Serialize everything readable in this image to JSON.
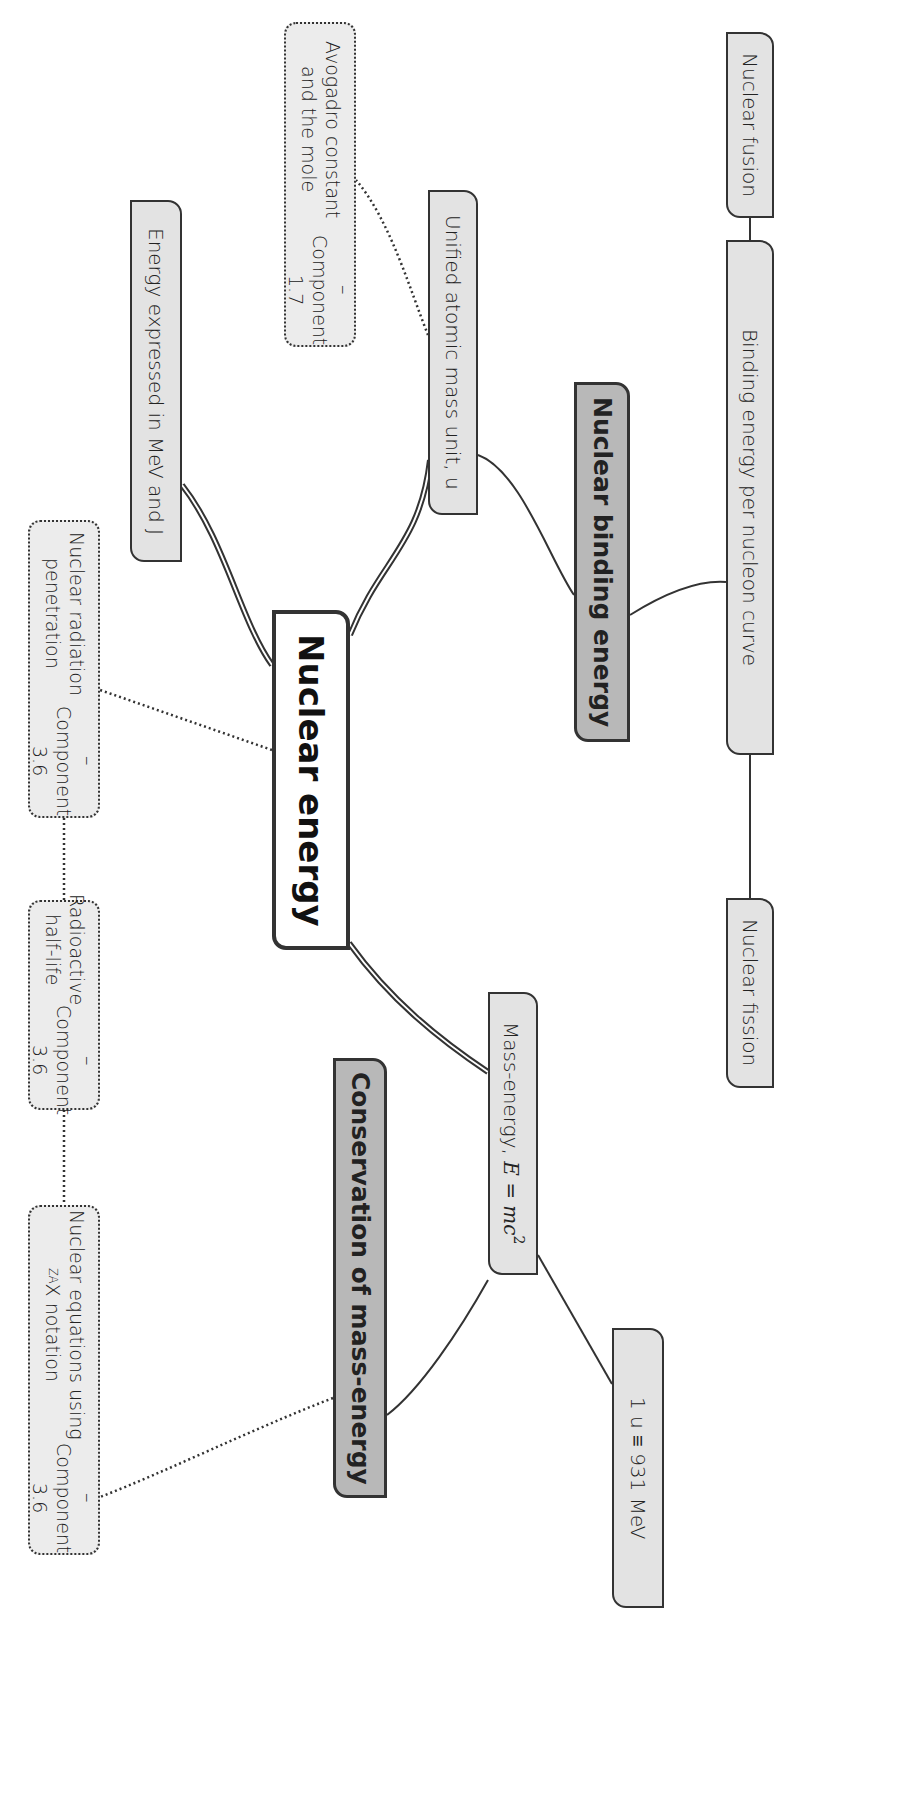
{
  "diagram": {
    "title": "Nuclear energy",
    "orientation": "rotated 90 degrees clockwise",
    "nodes": {
      "center": {
        "label": "Nuclear energy"
      },
      "binding": {
        "label": "Nuclear binding energy"
      },
      "conservation": {
        "label": "Conservation of mass-energy"
      },
      "fusion": {
        "label": "Nuclear fusion"
      },
      "curve": {
        "label": "Binding energy per nucleon curve"
      },
      "fission": {
        "label": "Nuclear fission"
      },
      "amu": {
        "label": "Unified atomic mass unit, u"
      },
      "avogadro": {
        "line1": "Avogadro constant and the mole",
        "line2": "– Component 1.7"
      },
      "mev": {
        "label": "Energy expressed in MeV and J"
      },
      "radiation": {
        "line1": "Nuclear radiation penetration",
        "line2": "– Component 3.6"
      },
      "halflife": {
        "line1": "Radioactive half-life",
        "line2": "– Component 3.6"
      },
      "equations": {
        "line1_pre": "Nuclear equations using ",
        "notation_sup": "A",
        "notation_sub": "Z",
        "notation_sym": "X",
        "line1_post": " notation",
        "line2": "– Component 3.6"
      },
      "massenergy": {
        "pre": "Mass-energy, ",
        "formula": "E = mc",
        "exp": "2"
      },
      "u931": {
        "label": "1 u ≡ 931 MeV"
      }
    },
    "edges": [
      {
        "from": "center",
        "to": "amu",
        "style": "double"
      },
      {
        "from": "center",
        "to": "mev",
        "style": "double"
      },
      {
        "from": "center",
        "to": "massenergy",
        "style": "double"
      },
      {
        "from": "center",
        "to": "radiation",
        "style": "dotted"
      },
      {
        "from": "amu",
        "to": "binding",
        "style": "solid"
      },
      {
        "from": "amu",
        "to": "avogadro",
        "style": "dotted"
      },
      {
        "from": "binding",
        "to": "curve",
        "style": "solid"
      },
      {
        "from": "curve",
        "to": "fusion",
        "style": "solid"
      },
      {
        "from": "curve",
        "to": "fission",
        "style": "solid"
      },
      {
        "from": "massenergy",
        "to": "conservation",
        "style": "solid"
      },
      {
        "from": "massenergy",
        "to": "u931",
        "style": "solid"
      },
      {
        "from": "conservation",
        "to": "equations",
        "style": "dotted"
      },
      {
        "from": "radiation",
        "to": "halflife",
        "style": "dotted"
      },
      {
        "from": "halflife",
        "to": "equations",
        "style": "dotted"
      }
    ],
    "colors": {
      "center_fill": "#ffffff",
      "main_topic_fill": "#b8b8b8",
      "subtopic_fill": "#e3e3e3",
      "external_fill": "#ececec",
      "stroke": "#333333"
    }
  }
}
